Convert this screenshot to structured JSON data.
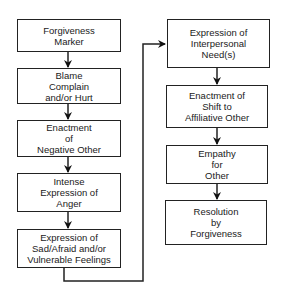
{
  "diagram": {
    "type": "flowchart",
    "left_column": [
      {
        "id": "forgiveness-marker",
        "lines": [
          "Forgiveness",
          "Marker"
        ]
      },
      {
        "id": "blame-complain-hurt",
        "lines": [
          "Blame",
          "Complain",
          "and/or Hurt"
        ]
      },
      {
        "id": "enactment-negative-other",
        "lines": [
          "Enactment",
          "of",
          "Negative Other"
        ]
      },
      {
        "id": "intense-expression-anger",
        "lines": [
          "Intense",
          "Expression of",
          "Anger"
        ]
      },
      {
        "id": "expression-sad-afraid",
        "lines": [
          "Expression of",
          "Sad/Afraid and/or",
          "Vulnerable Feelings"
        ]
      }
    ],
    "right_column": [
      {
        "id": "expression-interpersonal-needs",
        "lines": [
          "Expression of",
          "Interpersonal",
          "Need(s)"
        ]
      },
      {
        "id": "enactment-shift-affiliative",
        "lines": [
          "Enactment of",
          "Shift to",
          "Affiliative Other"
        ]
      },
      {
        "id": "empathy-for-other",
        "lines": [
          "Empathy",
          "for",
          "Other"
        ]
      },
      {
        "id": "resolution-forgiveness",
        "lines": [
          "Resolution",
          "by",
          "Forgiveness"
        ]
      }
    ],
    "edges": [
      [
        "forgiveness-marker",
        "blame-complain-hurt"
      ],
      [
        "blame-complain-hurt",
        "enactment-negative-other"
      ],
      [
        "enactment-negative-other",
        "intense-expression-anger"
      ],
      [
        "intense-expression-anger",
        "expression-sad-afraid"
      ],
      [
        "expression-sad-afraid",
        "expression-interpersonal-needs"
      ],
      [
        "expression-interpersonal-needs",
        "enactment-shift-affiliative"
      ],
      [
        "enactment-shift-affiliative",
        "empathy-for-other"
      ],
      [
        "empathy-for-other",
        "resolution-forgiveness"
      ]
    ]
  }
}
